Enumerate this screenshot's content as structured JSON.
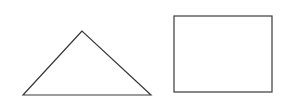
{
  "canvas": {
    "width": 297,
    "height": 109,
    "background": "#ffffff"
  },
  "stroke": {
    "color": "#3a3a3a",
    "width": 1.2
  },
  "shapes": [
    {
      "type": "triangle",
      "points": "82,31 23,95 151,95"
    },
    {
      "type": "rectangle",
      "x": 174,
      "y": 16,
      "width": 98,
      "height": 76
    }
  ]
}
